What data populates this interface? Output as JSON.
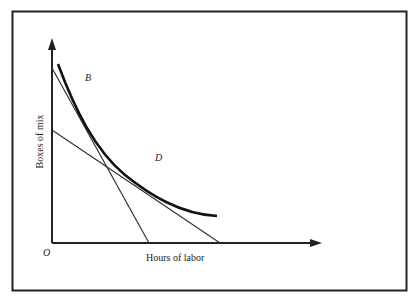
{
  "figure": {
    "x_axis_label": "Hours of labor",
    "y_axis_label": "Boxes of mix",
    "origin_label": "O",
    "points": [
      {
        "label": "B"
      },
      {
        "label": "D"
      }
    ],
    "elements": [
      "isoquant (convex curve)",
      "steep isocost line tangent at B",
      "shallow isocost line tangent at D"
    ],
    "colors": {
      "ink": "#222222",
      "background": "#ffffff"
    }
  }
}
